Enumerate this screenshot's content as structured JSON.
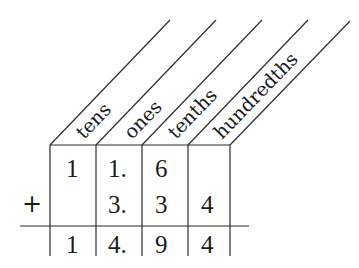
{
  "diagram": {
    "type": "place-value-addition",
    "columns": [
      {
        "label": "tens"
      },
      {
        "label": "ones"
      },
      {
        "label": "tenths"
      },
      {
        "label": "hundredths"
      }
    ],
    "operator": "+",
    "rows": [
      {
        "name": "addend-1",
        "cells": [
          "1",
          "1.",
          "6",
          ""
        ]
      },
      {
        "name": "addend-2",
        "cells": [
          "",
          "3.",
          "3",
          "4"
        ]
      },
      {
        "name": "sum",
        "cells": [
          "1",
          "4.",
          "9",
          "4"
        ]
      }
    ],
    "expression": {
      "addend_1": "11.6",
      "addend_2": "3.34",
      "sum": "14.94"
    },
    "colors": {
      "ink": "#1a1a1a",
      "background": "#ffffff"
    }
  }
}
